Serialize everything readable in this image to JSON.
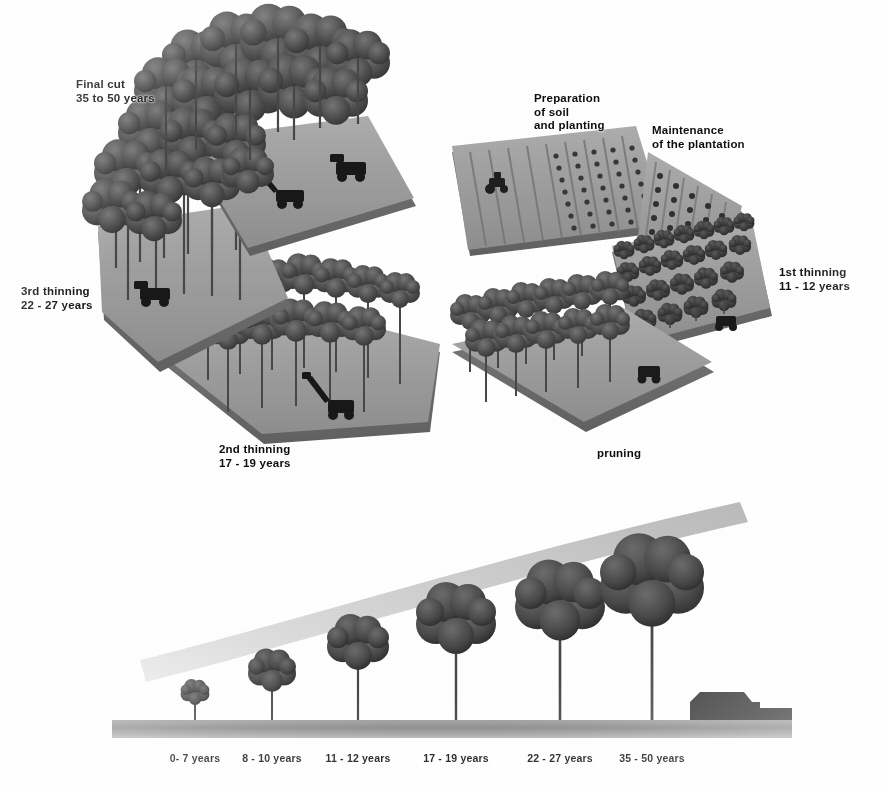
{
  "diagram": {
    "palette": {
      "platform_top": "#9a9a9a",
      "platform_side": "#6f6f6f",
      "tree_crown": "#5a5a5a",
      "tree_crown_dark": "#3d3d3d",
      "trunk": "#4a4a4a",
      "machine": "#2b2b2b",
      "ground_bar": "#8d8d8d",
      "arc_sweep": "#c9c9c9",
      "label_text": "#111111",
      "background": "#fdfdfd"
    },
    "cycle_stages": [
      {
        "id": "preparation",
        "label": "Preparation\nof soil\nand planting",
        "years": "",
        "scene": "plowed-furrows-with-tractor-and-seedling-rows",
        "label_x": 534,
        "label_y": 92
      },
      {
        "id": "maintenance",
        "label": "Maintenance\nof the plantation",
        "years": "",
        "scene": "young-dense-seedling-rows",
        "label_x": 652,
        "label_y": 124
      },
      {
        "id": "first-thinning",
        "label": "1st thinning\n11 - 12 years",
        "years": "11 - 12 years",
        "scene": "dense-young-tree-rows-with-vehicle",
        "label_x": 779,
        "label_y": 266
      },
      {
        "id": "pruning",
        "label": "pruning",
        "years": "",
        "scene": "spaced-trees-with-vehicle",
        "label_x": 597,
        "label_y": 447
      },
      {
        "id": "second-thinning",
        "label": "2nd thinning\n17 - 19 years",
        "years": "17 - 19 years",
        "scene": "tall-trees-with-excavator",
        "label_x": 219,
        "label_y": 443
      },
      {
        "id": "third-thinning",
        "label": "3rd thinning\n22 - 27 years",
        "years": "22 - 27 years",
        "scene": "tall-trunks-with-forwarder",
        "label_x": 21,
        "label_y": 285
      },
      {
        "id": "final-cut",
        "label": "Final cut\n35 to 50 years",
        "years": "35 to 50 years",
        "scene": "mature-canopy-with-harvesters-and-clearing",
        "label_x": 76,
        "label_y": 78
      }
    ],
    "timeline": {
      "axis_label": "",
      "ticks": [
        {
          "label": "0- 7 years",
          "x": 195,
          "tree_height": 26,
          "crown_r": 11,
          "tick": false
        },
        {
          "label": "8 - 10 years",
          "x": 272,
          "tree_height": 52,
          "crown_r": 19,
          "tick": false
        },
        {
          "label": "11 - 12 years",
          "x": 358,
          "tree_height": 86,
          "crown_r": 26,
          "tick": true
        },
        {
          "label": "17 - 19 years",
          "x": 456,
          "tree_height": 120,
          "crown_r": 34,
          "tick": true
        },
        {
          "label": "22 - 27 years",
          "x": 560,
          "tree_height": 145,
          "crown_r": 38,
          "tick": true
        },
        {
          "label": "35 - 50 years",
          "x": 652,
          "tree_height": 172,
          "crown_r": 44,
          "tick": true
        }
      ],
      "ground": {
        "x1": 112,
        "x2": 792,
        "y": 722,
        "thickness": 18
      },
      "truck": {
        "x": 690,
        "label": "log-truck"
      }
    }
  }
}
